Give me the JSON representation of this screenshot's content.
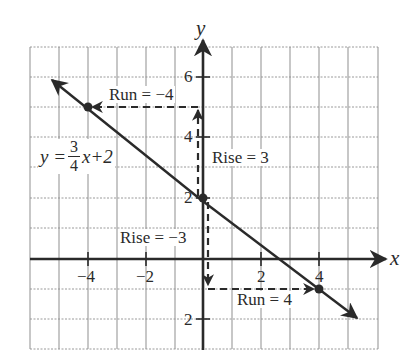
{
  "diagram": {
    "type": "coordinate-graph-line-slope",
    "axes": {
      "x_label": "x",
      "y_label": "y",
      "x_range": [
        -6,
        6
      ],
      "y_range": [
        -3,
        7
      ],
      "x_tick_labels": [
        {
          "value": -4,
          "text": "−4"
        },
        {
          "value": -2,
          "text": "−2"
        },
        {
          "value": 2,
          "text": "2"
        },
        {
          "value": 4,
          "text": "4"
        }
      ],
      "y_tick_labels": [
        {
          "value": 6,
          "text": "6"
        },
        {
          "value": 4,
          "text": "4"
        },
        {
          "value": 2,
          "text": "2"
        },
        {
          "value": -2,
          "text": "2"
        }
      ],
      "grid": true
    },
    "line": {
      "equation_lhs": "y =",
      "slope_numerator": "3",
      "slope_denominator": "4",
      "equation_rhs": "x+2",
      "points": [
        {
          "x": -4,
          "y": 5
        },
        {
          "x": 0,
          "y": 2
        },
        {
          "x": 4,
          "y": -1
        }
      ]
    },
    "annotations": {
      "run_neg": "Run = −4",
      "rise_pos": "Rise = 3",
      "rise_neg": "Rise = −3",
      "run_pos": "Run = 4"
    },
    "colors": {
      "ink": "#2a2a2a",
      "grid": "#9a9a9a",
      "background": "#ffffff"
    }
  }
}
